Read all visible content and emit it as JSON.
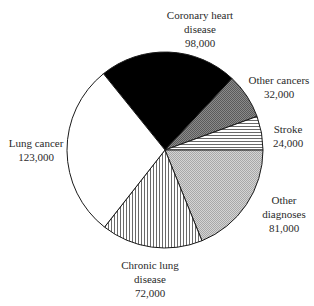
{
  "chart_data": {
    "type": "pie",
    "title": "",
    "total": 430000,
    "slices": [
      {
        "name": "Coronary heart disease",
        "label_lines": [
          "Coronary heart",
          "disease"
        ],
        "value": 98000,
        "value_label": "98,000",
        "fill": "solid-black"
      },
      {
        "name": "Other cancers",
        "label_lines": [
          "Other cancers"
        ],
        "value": 32000,
        "value_label": "32,000",
        "fill": "dense-crosshatch-dark"
      },
      {
        "name": "Stroke",
        "label_lines": [
          "Stroke"
        ],
        "value": 24000,
        "value_label": "24,000",
        "fill": "horizontal-lines"
      },
      {
        "name": "Other diagnoses",
        "label_lines": [
          "Other",
          "diagnoses"
        ],
        "value": 81000,
        "value_label": "81,000",
        "fill": "dense-crosshatch-light"
      },
      {
        "name": "Chronic lung disease",
        "label_lines": [
          "Chronic lung",
          "disease"
        ],
        "value": 72000,
        "value_label": "72,000",
        "fill": "vertical-lines"
      },
      {
        "name": "Lung cancer",
        "label_lines": [
          "Lung cancer"
        ],
        "value": 123000,
        "value_label": "123,000",
        "fill": "white"
      }
    ],
    "start_angle_deg": -128.9,
    "direction": "clockwise",
    "legend": "none",
    "labels_position": "outside"
  },
  "labels": {
    "coronary": {
      "line1": "Coronary heart",
      "line2": "disease",
      "value": "98,000"
    },
    "other_cancers": {
      "line1": "Other cancers",
      "value": "32,000"
    },
    "stroke": {
      "line1": "Stroke",
      "value": "24,000"
    },
    "other_diagnoses": {
      "line1": "Other",
      "line2": "diagnoses",
      "value": "81,000"
    },
    "chronic_lung": {
      "line1": "Chronic lung",
      "line2": "disease",
      "value": "72,000"
    },
    "lung_cancer": {
      "line1": "Lung cancer",
      "value": "123,000"
    }
  }
}
